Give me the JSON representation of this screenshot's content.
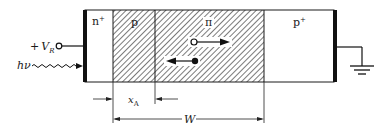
{
  "diagram": {
    "type": "reach-through avalanche photodiode structure",
    "regions": [
      {
        "id": "n_plus",
        "label": "n",
        "sup": "+",
        "hatched": false
      },
      {
        "id": "p",
        "label": "p",
        "sup": "",
        "hatched": true
      },
      {
        "id": "pi",
        "label": "π",
        "sup": "",
        "hatched": true
      },
      {
        "id": "p_plus",
        "label": "p",
        "sup": "+",
        "hatched": false
      }
    ],
    "bias": {
      "sign": "+",
      "symbol": "V",
      "subscript": "R"
    },
    "light": {
      "label": "hν"
    },
    "dimensions": {
      "xa": {
        "symbol": "x",
        "subscript": "A"
      },
      "w": {
        "symbol": "W"
      }
    },
    "ground": {
      "label": "ground"
    }
  }
}
